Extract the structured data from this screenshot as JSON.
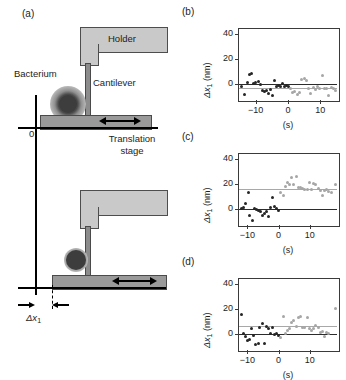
{
  "figure": {
    "panels": [
      "a",
      "b",
      "c",
      "d"
    ]
  },
  "panel_a": {
    "label": "(a)",
    "labels": {
      "holder": "Holder",
      "cantilever": "Cantilever",
      "bacterium": "Bacterium",
      "translation_stage_line1": "Translation",
      "translation_stage_line2": "stage",
      "origin": "0",
      "displacement": "Δx",
      "displacement_sub": "1"
    },
    "colors": {
      "holder_fill": "#c9c9c9",
      "cantilever_fill": "#8c8c8c",
      "stage_fill": "#9a9a9a",
      "outline": "#4a4a4a",
      "bacterium_core": "#3d3d3d"
    }
  },
  "chart_data": [
    {
      "panel": "b",
      "type": "scatter",
      "title": "(b)",
      "xlabel": "(s)",
      "ylabel": "Δx₁ (nm)",
      "ylabel_main": "Δx",
      "ylabel_sub": "1",
      "ylabel_unit": " (nm)",
      "xlim": [
        -15.5,
        15.5
      ],
      "ylim": [
        -13,
        45
      ],
      "xticks": [
        -10,
        0,
        10
      ],
      "xticklabels": [
        "−10",
        "0",
        "10"
      ],
      "yticks": [
        0,
        20,
        40
      ],
      "yticklabels": [
        "0",
        "20",
        "40"
      ],
      "grid": false,
      "reference_lines": [
        {
          "name": "baseline",
          "y": 0,
          "color": "#2b2b2b"
        },
        {
          "name": "mean",
          "y": -3,
          "color": "#a8a8a8"
        }
      ],
      "series": [
        {
          "name": "before-detachment",
          "color": "#262626",
          "points": [
            [
              -14.3,
              -2.0
            ],
            [
              -13.6,
              -8.5
            ],
            [
              -12.6,
              1.5
            ],
            [
              -11.9,
              7.5
            ],
            [
              -11.2,
              8.5
            ],
            [
              -10.6,
              0.5
            ],
            [
              -10.0,
              1.0
            ],
            [
              -9.3,
              2.0
            ],
            [
              -8.6,
              -0.5
            ],
            [
              -8.0,
              -5.5
            ],
            [
              -7.4,
              -6.5
            ],
            [
              -6.8,
              -5.0
            ],
            [
              -6.1,
              -8.0
            ],
            [
              -5.5,
              -4.5
            ],
            [
              -4.9,
              -9.0
            ],
            [
              -4.3,
              2.5
            ],
            [
              -3.6,
              -2.5
            ],
            [
              -3.0,
              -1.5
            ],
            [
              -2.4,
              -2.0
            ],
            [
              -1.8,
              0.5
            ],
            [
              -1.2,
              -2.5
            ],
            [
              -0.6,
              -1.5
            ],
            [
              0.0,
              -2.0
            ]
          ]
        },
        {
          "name": "after-detachment",
          "color": "#a6a6a6",
          "points": [
            [
              0.7,
              -3.5
            ],
            [
              1.4,
              -7.0
            ],
            [
              2.1,
              -6.5
            ],
            [
              2.8,
              -8.5
            ],
            [
              3.5,
              -7.0
            ],
            [
              4.3,
              3.5
            ],
            [
              5.0,
              4.0
            ],
            [
              5.7,
              3.0
            ],
            [
              6.4,
              -3.5
            ],
            [
              7.1,
              -7.5
            ],
            [
              7.8,
              -3.0
            ],
            [
              8.5,
              -4.5
            ],
            [
              9.2,
              -2.5
            ],
            [
              9.9,
              -3.5
            ],
            [
              10.6,
              6.5
            ],
            [
              11.3,
              -3.5
            ],
            [
              12.0,
              -4.0
            ],
            [
              12.7,
              -9.0
            ],
            [
              13.4,
              -3.0
            ],
            [
              14.1,
              -3.5
            ],
            [
              14.8,
              -5.0
            ]
          ]
        }
      ]
    },
    {
      "panel": "c",
      "type": "scatter",
      "title": "(c)",
      "xlabel": "(s)",
      "ylabel": "Δx₁ (nm)",
      "ylabel_main": "Δx",
      "ylabel_sub": "1",
      "ylabel_unit": " (nm)",
      "xlim": [
        -13,
        19
      ],
      "ylim": [
        -13,
        45
      ],
      "xticks": [
        -10,
        0,
        10
      ],
      "xticklabels": [
        "−10",
        "0",
        "10"
      ],
      "yticks": [
        0,
        20,
        40
      ],
      "yticklabels": [
        "0",
        "20",
        "40"
      ],
      "grid": false,
      "reference_lines": [
        {
          "name": "baseline",
          "y": 0,
          "color": "#2b2b2b"
        },
        {
          "name": "mean",
          "y": 16,
          "color": "#a8a8a8"
        }
      ],
      "series": [
        {
          "name": "before-detachment",
          "color": "#262626",
          "points": [
            [
              -11.8,
              0.5
            ],
            [
              -11.2,
              1.5
            ],
            [
              -10.5,
              4.5
            ],
            [
              -9.8,
              13.5
            ],
            [
              -9.2,
              -5.0
            ],
            [
              -8.5,
              -9.5
            ],
            [
              -7.8,
              0.5
            ],
            [
              -7.2,
              -0.5
            ],
            [
              -6.5,
              -1.5
            ],
            [
              -5.9,
              -2.0
            ],
            [
              -5.2,
              -5.5
            ],
            [
              -4.6,
              -4.0
            ],
            [
              -3.9,
              -2.5
            ],
            [
              -3.3,
              -6.0
            ],
            [
              -2.6,
              1.0
            ],
            [
              -2.0,
              9.5
            ],
            [
              -1.3,
              2.0
            ],
            [
              -0.7,
              0.0
            ],
            [
              0.0,
              -1.5
            ]
          ]
        },
        {
          "name": "after-detachment",
          "color": "#a6a6a6",
          "points": [
            [
              0.7,
              13.0
            ],
            [
              1.4,
              11.0
            ],
            [
              2.1,
              18.0
            ],
            [
              2.8,
              21.0
            ],
            [
              3.5,
              19.5
            ],
            [
              4.2,
              25.0
            ],
            [
              4.9,
              20.0
            ],
            [
              5.6,
              26.0
            ],
            [
              6.3,
              17.0
            ],
            [
              7.0,
              17.5
            ],
            [
              7.7,
              16.5
            ],
            [
              8.4,
              16.0
            ],
            [
              9.1,
              15.5
            ],
            [
              9.8,
              21.0
            ],
            [
              10.5,
              16.0
            ],
            [
              11.2,
              20.5
            ],
            [
              11.9,
              20.0
            ],
            [
              12.6,
              16.5
            ],
            [
              13.3,
              15.0
            ],
            [
              14.0,
              11.0
            ],
            [
              14.7,
              14.5
            ],
            [
              15.4,
              16.0
            ],
            [
              16.1,
              14.0
            ],
            [
              16.8,
              13.5
            ],
            [
              18.2,
              19.5
            ]
          ]
        }
      ]
    },
    {
      "panel": "d",
      "type": "scatter",
      "title": "(d)",
      "xlabel": "(s)",
      "ylabel": "Δx₁ (nm)",
      "ylabel_main": "Δx",
      "ylabel_sub": "1",
      "ylabel_unit": " (nm)",
      "xlim": [
        -13,
        19
      ],
      "ylim": [
        -13,
        45
      ],
      "xticks": [
        -10,
        0,
        10
      ],
      "xticklabels": [
        "−10",
        "0",
        "10"
      ],
      "yticks": [
        0,
        20,
        40
      ],
      "yticklabels": [
        "0",
        "20",
        "40"
      ],
      "grid": false,
      "reference_lines": [
        {
          "name": "baseline",
          "y": 0,
          "color": "#2b2b2b"
        },
        {
          "name": "mean",
          "y": 6,
          "color": "#a8a8a8"
        }
      ],
      "series": [
        {
          "name": "before-detachment",
          "color": "#262626",
          "points": [
            [
              -12.0,
              15.5
            ],
            [
              -11.4,
              0.5
            ],
            [
              -10.7,
              -2.0
            ],
            [
              -10.0,
              -5.5
            ],
            [
              -9.3,
              -4.5
            ],
            [
              -8.6,
              4.0
            ],
            [
              -8.0,
              -1.0
            ],
            [
              -7.3,
              -8.5
            ],
            [
              -6.6,
              -8.0
            ],
            [
              -6.0,
              5.5
            ],
            [
              -5.3,
              8.5
            ],
            [
              -4.6,
              -7.5
            ],
            [
              -4.0,
              6.0
            ],
            [
              -3.3,
              4.5
            ],
            [
              -2.6,
              0.0
            ],
            [
              -2.0,
              5.5
            ],
            [
              -1.3,
              -0.5
            ],
            [
              -0.6,
              0.0
            ],
            [
              0.0,
              -1.5
            ]
          ]
        },
        {
          "name": "after-detachment",
          "color": "#a6a6a6",
          "points": [
            [
              0.7,
              -3.0
            ],
            [
              1.4,
              14.0
            ],
            [
              2.1,
              0.5
            ],
            [
              2.8,
              2.5
            ],
            [
              3.5,
              4.5
            ],
            [
              4.2,
              9.0
            ],
            [
              4.9,
              11.0
            ],
            [
              5.6,
              6.0
            ],
            [
              6.3,
              13.5
            ],
            [
              7.0,
              14.0
            ],
            [
              7.7,
              5.5
            ],
            [
              8.4,
              5.0
            ],
            [
              9.1,
              13.5
            ],
            [
              9.8,
              4.5
            ],
            [
              10.5,
              3.0
            ],
            [
              11.2,
              4.5
            ],
            [
              11.9,
              6.5
            ],
            [
              12.6,
              5.5
            ],
            [
              13.3,
              1.5
            ],
            [
              14.0,
              2.0
            ],
            [
              14.7,
              -2.0
            ],
            [
              15.4,
              1.5
            ],
            [
              16.1,
              0.5
            ],
            [
              18.3,
              20.5
            ]
          ]
        }
      ]
    }
  ]
}
